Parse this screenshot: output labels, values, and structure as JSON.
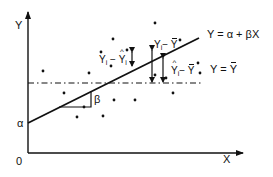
{
  "diagram": {
    "type": "linear-regression-decomposition",
    "axes": {
      "y_label": "Y",
      "x_label": "X",
      "origin_label": "0"
    },
    "regression_line": {
      "label": "Y = α + βX",
      "intercept_label": "α",
      "slope_label": "β"
    },
    "mean_line": {
      "label_lhs": "Y = ",
      "label_rhs": "Y",
      "style": "dash-dot"
    },
    "deviation_labels": {
      "residual": {
        "a": "Y",
        "a_sub": "i",
        "op": " − ",
        "b": "Y",
        "b_sub": "i"
      },
      "total": {
        "a": "Y",
        "a_sub": "i",
        "op": "− ",
        "b": "Y"
      },
      "explained": {
        "a": "Y",
        "a_sub": "i",
        "op": "− ",
        "b": "Y"
      }
    },
    "points": [
      [
        43,
        71
      ],
      [
        89,
        73
      ],
      [
        101,
        52
      ],
      [
        111,
        66
      ],
      [
        127,
        50
      ],
      [
        155,
        23
      ],
      [
        180,
        40
      ],
      [
        155,
        75
      ],
      [
        198,
        63
      ],
      [
        200,
        73
      ],
      [
        173,
        93
      ],
      [
        64,
        93
      ],
      [
        84,
        107
      ],
      [
        103,
        116
      ],
      [
        114,
        100
      ],
      [
        135,
        100
      ],
      [
        77,
        117
      ],
      [
        113,
        39
      ],
      [
        166,
        78
      ]
    ],
    "colors": {
      "ink": "#111111",
      "background": "#ffffff"
    }
  }
}
